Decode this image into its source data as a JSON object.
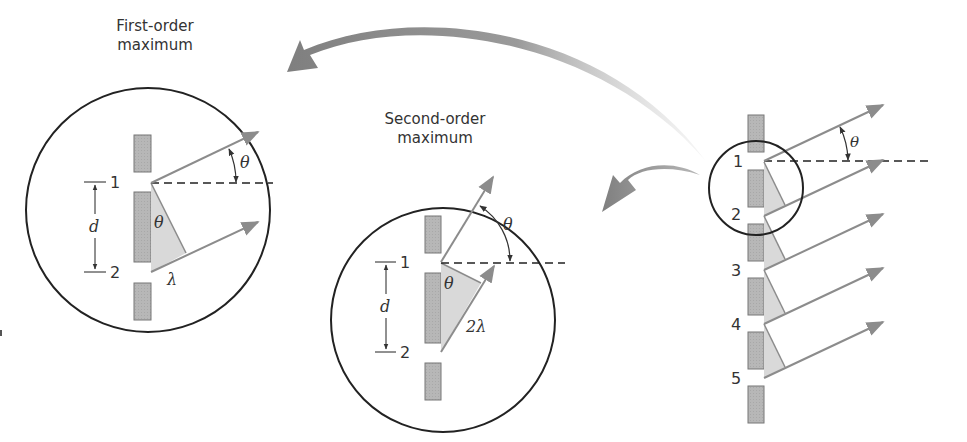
{
  "figure": {
    "colors": {
      "background": "#ffffff",
      "outline": "#222222",
      "ray": "#8c8c8c",
      "slit_bar": "#b3b3b3",
      "path_triangle": "#d9d9d9",
      "callout_arrow": "#8a8a8a"
    },
    "first_order_panel": {
      "caption_line1": "First-order",
      "caption_line2": "maximum",
      "slit_label_1": "1",
      "slit_label_2": "2",
      "spacing_label": "d",
      "angle_label": "θ",
      "triangle_angle_label": "θ",
      "path_difference_label": "λ"
    },
    "second_order_panel": {
      "caption_line1": "Second-order",
      "caption_line2": "maximum",
      "slit_label_1": "1",
      "slit_label_2": "2",
      "spacing_label": "d",
      "angle_label": "θ",
      "triangle_angle_label": "θ",
      "path_difference_label": "2λ"
    },
    "grating_panel": {
      "slit_labels": [
        "1",
        "2",
        "3",
        "4",
        "5"
      ],
      "angle_label": "θ"
    }
  }
}
